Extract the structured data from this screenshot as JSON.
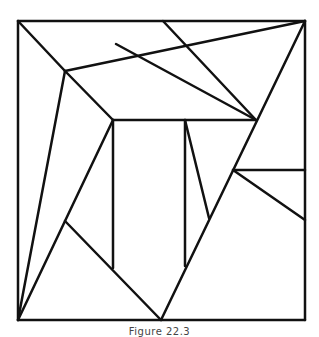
{
  "figure": {
    "caption": "Figure 22.3",
    "stroke_color": "#111111",
    "background": "#ffffff",
    "stroke_width": 2.5,
    "segments": [
      {
        "id": "square-top",
        "x1": 18,
        "y1": 21,
        "x2": 305,
        "y2": 21
      },
      {
        "id": "square-right",
        "x1": 305,
        "y1": 21,
        "x2": 305,
        "y2": 320
      },
      {
        "id": "square-bottom",
        "x1": 18,
        "y1": 320,
        "x2": 305,
        "y2": 320
      },
      {
        "id": "square-left",
        "x1": 18,
        "y1": 21,
        "x2": 18,
        "y2": 320
      },
      {
        "id": "diag-topleft-to-A",
        "x1": 18,
        "y1": 21,
        "x2": 65,
        "y2": 71
      },
      {
        "id": "A-to-topright",
        "x1": 65,
        "y1": 71,
        "x2": 305,
        "y2": 21
      },
      {
        "id": "B-to-D",
        "x1": 116,
        "y1": 44,
        "x2": 256,
        "y2": 120
      },
      {
        "id": "top-to-D",
        "x1": 163,
        "y1": 21,
        "x2": 256,
        "y2": 120
      },
      {
        "id": "A-to-C",
        "x1": 65,
        "y1": 71,
        "x2": 113,
        "y2": 120
      },
      {
        "id": "A-to-bottomleft",
        "x1": 65,
        "y1": 71,
        "x2": 18,
        "y2": 320
      },
      {
        "id": "C-to-bottomleft",
        "x1": 113,
        "y1": 120,
        "x2": 18,
        "y2": 320
      },
      {
        "id": "rect-top",
        "x1": 113,
        "y1": 120,
        "x2": 256,
        "y2": 120
      },
      {
        "id": "rect-left",
        "x1": 113,
        "y1": 120,
        "x2": 113,
        "y2": 268
      },
      {
        "id": "rect-mid",
        "x1": 185,
        "y1": 120,
        "x2": 185,
        "y2": 266
      },
      {
        "id": "mid-diag",
        "x1": 185,
        "y1": 120,
        "x2": 209,
        "y2": 218
      },
      {
        "id": "topright-to-bottom",
        "x1": 305,
        "y1": 21,
        "x2": 161,
        "y2": 320
      },
      {
        "id": "E-to-bottom",
        "x1": 65,
        "y1": 221,
        "x2": 161,
        "y2": 320
      },
      {
        "id": "F-horizontal",
        "x1": 233,
        "y1": 170,
        "x2": 305,
        "y2": 170
      },
      {
        "id": "F-diag",
        "x1": 233,
        "y1": 170,
        "x2": 305,
        "y2": 220
      }
    ]
  }
}
